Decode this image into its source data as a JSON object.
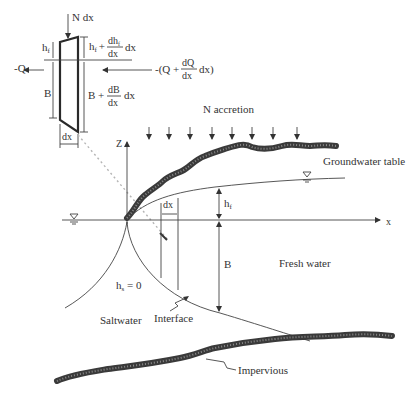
{
  "element": {
    "top_load": "N dx",
    "left_flux": "-Q",
    "right_flux_prefix": "-(Q +",
    "right_flux_num": "dQ",
    "right_flux_den": "dx",
    "right_flux_suffix": "dx)",
    "hf_left": "h",
    "hf_left_sub": "f",
    "hf_right_prefix": "h",
    "hf_right_sub": "f",
    "hf_right_plus": "+",
    "hf_right_num": "dh",
    "hf_right_num_sub": "f",
    "hf_right_den": "dx",
    "hf_right_suffix": "dx",
    "b_left": "B",
    "b_right_prefix": "B +",
    "b_right_num": "dB",
    "b_right_den": "dx",
    "b_right_suffix": "dx",
    "width_label": "dx"
  },
  "main": {
    "accretion_label": "N accretion",
    "z_axis": "Z",
    "x_axis": "x",
    "groundwater_label": "Groundwater table",
    "dx_label": "dx",
    "hf_label": "h",
    "hf_sub": "f",
    "b_label": "B",
    "fresh_water": "Fresh water",
    "hs_label": "h",
    "hs_sub": "s",
    "hs_value": " = 0",
    "saltwater": "Saltwater",
    "interface": "Interface",
    "impervious": "Impervious"
  },
  "colors": {
    "ink": "#333333",
    "background": "#ffffff",
    "hatch": "#3a3a3a",
    "dashed": "#b5b5b5"
  }
}
